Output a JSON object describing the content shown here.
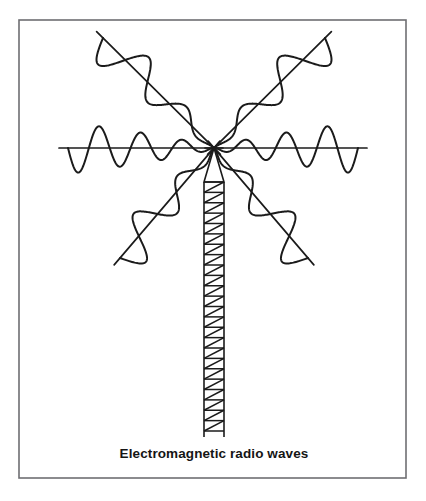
{
  "figure": {
    "caption": "Electromagnetic radio waves",
    "style": "black and white line drawing",
    "frame": {
      "x": 19,
      "y": 20,
      "width": 387,
      "height": 458,
      "stroke_color": "#6e6e72",
      "fill_color": "#ffffff"
    },
    "ink_color": "#1b1b1b",
    "background_color": "#ffffff"
  },
  "chart_data": {
    "type": "line",
    "title": "Electromagnetic radio waves",
    "xlabel": "",
    "ylabel": "",
    "grid": false,
    "legend": null,
    "source_point": {
      "x": 214,
      "y": 148,
      "label": "antenna tip emission point"
    },
    "series": [
      {
        "name": "horizontal-wave-left",
        "direction_degrees": 180,
        "cycles": 3.5,
        "amplitude_px": 26,
        "start": {
          "x": 68,
          "y": 148
        },
        "end": {
          "x": 214,
          "y": 148
        }
      },
      {
        "name": "horizontal-wave-right",
        "direction_degrees": 0,
        "cycles": 3.5,
        "amplitude_px": 26,
        "start": {
          "x": 214,
          "y": 148
        },
        "end": {
          "x": 358,
          "y": 148
        }
      },
      {
        "name": "diagonal-wave-upper-left",
        "direction_degrees": 135,
        "cycles": 2.5,
        "amplitude_px": 24,
        "start": {
          "x": 103,
          "y": 38
        },
        "end": {
          "x": 214,
          "y": 148
        }
      },
      {
        "name": "diagonal-wave-upper-right",
        "direction_degrees": 45,
        "cycles": 2.5,
        "amplitude_px": 24,
        "start": {
          "x": 214,
          "y": 148
        },
        "end": {
          "x": 325,
          "y": 38
        }
      },
      {
        "name": "diagonal-wave-lower-left",
        "direction_degrees": 225,
        "cycles": 2.5,
        "amplitude_px": 24,
        "start": {
          "x": 120,
          "y": 258
        },
        "end": {
          "x": 214,
          "y": 148
        }
      },
      {
        "name": "diagonal-wave-lower-right",
        "direction_degrees": 315,
        "cycles": 2.5,
        "amplitude_px": 24,
        "start": {
          "x": 214,
          "y": 148
        },
        "end": {
          "x": 308,
          "y": 258
        }
      }
    ]
  },
  "tower": {
    "name": "lattice radio mast",
    "apex": {
      "x": 214,
      "y": 148
    },
    "lattice_top_y": 182,
    "lattice_bottom_y": 431,
    "base_y": 437,
    "left_x": 204,
    "right_x": 224,
    "rung_count": 24,
    "bracing": "diagonal zigzag"
  },
  "caption": {
    "text": "Electromagnetic radio waves",
    "x": 214,
    "y": 458,
    "align": "center",
    "weight": "bold",
    "color": "#151515"
  }
}
